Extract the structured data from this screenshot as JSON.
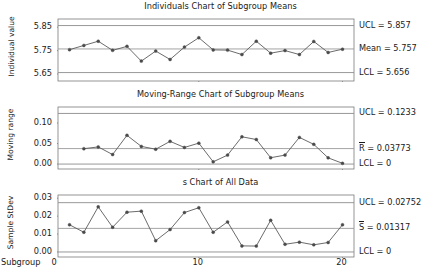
{
  "figure": {
    "xlabel": "Subgroup",
    "x_ticks": [
      "0",
      "10",
      "20"
    ],
    "x_tick_values": [
      0,
      10,
      20
    ]
  },
  "chart_data": [
    {
      "type": "line",
      "name": "individuals-chart",
      "title": "Individuals Chart of Subgroup Means",
      "xlabel": "Subgroup",
      "ylabel": "Individual value",
      "ylim": [
        5.62,
        5.885
      ],
      "y_ticks": [
        5.65,
        5.75,
        5.85
      ],
      "y_tick_labels": [
        "5.65",
        "5.75",
        "5.85"
      ],
      "xlim": [
        0.2,
        20.8
      ],
      "grid": false,
      "x": [
        1,
        2,
        3,
        4,
        5,
        6,
        7,
        8,
        9,
        10,
        11,
        12,
        13,
        14,
        15,
        16,
        17,
        18,
        19,
        20
      ],
      "values": [
        5.754,
        5.772,
        5.79,
        5.751,
        5.768,
        5.705,
        5.748,
        5.712,
        5.765,
        5.805,
        5.753,
        5.752,
        5.733,
        5.79,
        5.739,
        5.75,
        5.733,
        5.789,
        5.742,
        5.756
      ],
      "control_limits": {
        "ucl": 5.857,
        "center": 5.757,
        "lcl": 5.656,
        "ucl_label": "UCL = 5.857",
        "center_label": "Mean = 5.757",
        "lcl_label": "LCL = 5.656"
      }
    },
    {
      "type": "line",
      "name": "moving-range-chart",
      "title": "Moving-Range Chart of Subgroup Means",
      "xlabel": "Subgroup",
      "ylabel": "Moving range",
      "ylim": [
        -0.012,
        0.139
      ],
      "y_ticks": [
        0.0,
        0.05,
        0.1
      ],
      "y_tick_labels": [
        "0.00",
        "0.05",
        "0.10"
      ],
      "xlim": [
        0.2,
        20.8
      ],
      "grid": false,
      "x": [
        2,
        3,
        4,
        5,
        6,
        7,
        8,
        9,
        10,
        11,
        12,
        13,
        14,
        15,
        16,
        17,
        18,
        19,
        20
      ],
      "values": [
        0.0375,
        0.0418,
        0.0232,
        0.07,
        0.043,
        0.0362,
        0.0553,
        0.0405,
        0.051,
        0.0055,
        0.0218,
        0.0665,
        0.0598,
        0.0155,
        0.0218,
        0.065,
        0.048,
        0.0152,
        0.0018
      ],
      "control_limits": {
        "ucl": 0.1233,
        "center": 0.03773,
        "lcl": 0,
        "ucl_label": "UCL = 0.1233",
        "center_label_prefix": "R",
        "center_label_suffix": " = 0.03773",
        "lcl_label": "LCL = 0"
      }
    },
    {
      "type": "line",
      "name": "s-chart",
      "title": "s Chart of All Data",
      "xlabel": "Subgroup",
      "ylabel": "Sample StDev",
      "ylim": [
        -0.0028,
        0.0318
      ],
      "y_ticks": [
        0.0,
        0.01,
        0.02,
        0.03
      ],
      "y_tick_labels": [
        "0.00",
        "0.01",
        "0.02",
        "0.03"
      ],
      "xlim": [
        0.2,
        20.8
      ],
      "grid": false,
      "x": [
        1,
        2,
        3,
        4,
        5,
        6,
        7,
        8,
        9,
        10,
        11,
        12,
        13,
        14,
        15,
        16,
        17,
        18,
        19,
        20
      ],
      "values": [
        0.0152,
        0.011,
        0.0252,
        0.0138,
        0.0222,
        0.0228,
        0.0063,
        0.0125,
        0.022,
        0.0247,
        0.011,
        0.0168,
        0.0034,
        0.0033,
        0.0177,
        0.0043,
        0.0055,
        0.004,
        0.0053,
        0.0152
      ],
      "control_limits": {
        "ucl": 0.02752,
        "center": 0.01317,
        "lcl": 0,
        "ucl_label": "UCL = 0.02752",
        "center_label_prefix": "S",
        "center_label_suffix": " = 0.01317",
        "lcl_label": "LCL = 0"
      }
    }
  ],
  "style": {
    "line_color": "#5a5a5a",
    "marker_color": "#4a4a4a",
    "limit_color": "#8c8c8c",
    "center_color": "#9a9a9a",
    "frame_color": "#7a7a7a",
    "text_color": "#1a1a1a"
  }
}
